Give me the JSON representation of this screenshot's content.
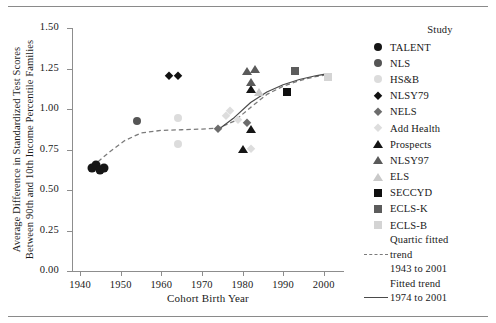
{
  "chart_data": {
    "type": "scatter",
    "title": "",
    "xlabel": "Cohort Birth Year",
    "ylabel_line1": "Average Difference in Standardized Test Scores",
    "ylabel_line2": "Between 90th and 10th Income Percentile Families",
    "xlim": [
      1938,
      2005
    ],
    "ylim": [
      0.0,
      1.5
    ],
    "xticks": [
      "1940",
      "1950",
      "1960",
      "1970",
      "1980",
      "1990",
      "2000"
    ],
    "xtick_values": [
      1940,
      1950,
      1960,
      1970,
      1980,
      1990,
      2000
    ],
    "yticks": [
      "0.00",
      "0.25",
      "0.50",
      "0.75",
      "1.00",
      "1.25",
      "1.50"
    ],
    "ytick_values": [
      0.0,
      0.25,
      0.5,
      0.75,
      1.0,
      1.25,
      1.5
    ],
    "grid": false,
    "legend_position": "right",
    "legend_title": "Study",
    "series": [
      {
        "name": "TALENT",
        "marker": "circle",
        "color": "#161616",
        "size": 9,
        "points": [
          {
            "x": 1943,
            "y": 0.635
          },
          {
            "x": 1944,
            "y": 0.655
          },
          {
            "x": 1945,
            "y": 0.625
          },
          {
            "x": 1946,
            "y": 0.635
          }
        ]
      },
      {
        "name": "NLS",
        "marker": "circle",
        "color": "#555555",
        "size": 8,
        "points": [
          {
            "x": 1954,
            "y": 0.925
          }
        ]
      },
      {
        "name": "HS&B",
        "marker": "circle",
        "color": "#dcdcdc",
        "size": 8,
        "points": [
          {
            "x": 1964,
            "y": 0.945
          },
          {
            "x": 1964,
            "y": 0.785
          }
        ]
      },
      {
        "name": "NLSY79",
        "marker": "diamond",
        "color": "#111111",
        "size": 8,
        "points": [
          {
            "x": 1962,
            "y": 1.205
          },
          {
            "x": 1964,
            "y": 1.205
          }
        ]
      },
      {
        "name": "NELS",
        "marker": "diamond",
        "color": "#6c6c6c",
        "size": 8,
        "points": [
          {
            "x": 1974,
            "y": 0.875
          },
          {
            "x": 1981,
            "y": 0.915
          }
        ]
      },
      {
        "name": "Add Health",
        "marker": "diamond",
        "color": "#dddddd",
        "size": 8,
        "points": [
          {
            "x": 1976,
            "y": 0.955
          },
          {
            "x": 1977,
            "y": 0.985
          },
          {
            "x": 1979,
            "y": 0.935
          },
          {
            "x": 1982,
            "y": 0.755
          }
        ]
      },
      {
        "name": "Prospects",
        "marker": "triangle",
        "color": "#151515",
        "size": 9,
        "points": [
          {
            "x": 1980,
            "y": 0.755
          },
          {
            "x": 1982,
            "y": 1.125
          },
          {
            "x": 1982,
            "y": 0.875
          }
        ]
      },
      {
        "name": "NLSY97",
        "marker": "triangle",
        "color": "#5a5a5a",
        "size": 9,
        "points": [
          {
            "x": 1981,
            "y": 1.235
          },
          {
            "x": 1982,
            "y": 1.165
          },
          {
            "x": 1983,
            "y": 1.245
          }
        ]
      },
      {
        "name": "ELS",
        "marker": "triangle",
        "color": "#c9c9c9",
        "size": 9,
        "points": [
          {
            "x": 1984,
            "y": 1.105
          }
        ]
      },
      {
        "name": "SECCYD",
        "marker": "square",
        "color": "#0f0f0f",
        "size": 8,
        "points": [
          {
            "x": 1991,
            "y": 1.105
          }
        ]
      },
      {
        "name": "ECLS-K",
        "marker": "square",
        "color": "#5c5c5c",
        "size": 8,
        "points": [
          {
            "x": 1993,
            "y": 1.235
          }
        ]
      },
      {
        "name": "ECLS-B",
        "marker": "square",
        "color": "#d4d4d4",
        "size": 8,
        "points": [
          {
            "x": 2001,
            "y": 1.195
          }
        ]
      }
    ],
    "trends": [
      {
        "name": "Quartic fitted trend 1943 to 2001",
        "style": "dashed",
        "color": "#7b7b7b",
        "label_line1": "Quartic fitted",
        "label_line2": "trend",
        "label_line3": "1943 to 2001",
        "path": [
          {
            "x": 1943,
            "y": 0.645
          },
          {
            "x": 1947,
            "y": 0.73
          },
          {
            "x": 1951,
            "y": 0.805
          },
          {
            "x": 1955,
            "y": 0.852
          },
          {
            "x": 1960,
            "y": 0.868
          },
          {
            "x": 1965,
            "y": 0.872
          },
          {
            "x": 1970,
            "y": 0.876
          },
          {
            "x": 1974,
            "y": 0.882
          },
          {
            "x": 1978,
            "y": 0.925
          },
          {
            "x": 1982,
            "y": 1.01
          },
          {
            "x": 1986,
            "y": 1.09
          },
          {
            "x": 1990,
            "y": 1.14
          },
          {
            "x": 1994,
            "y": 1.175
          },
          {
            "x": 1998,
            "y": 1.2
          },
          {
            "x": 2001,
            "y": 1.212
          }
        ]
      },
      {
        "name": "Fitted trend 1974 to 2001",
        "style": "solid",
        "color": "#4a4a4a",
        "label_line1": "Fitted trend",
        "label_line2": "1974 to 2001",
        "path": [
          {
            "x": 1974,
            "y": 0.872
          },
          {
            "x": 1978,
            "y": 0.948
          },
          {
            "x": 1982,
            "y": 1.04
          },
          {
            "x": 1986,
            "y": 1.105
          },
          {
            "x": 1990,
            "y": 1.15
          },
          {
            "x": 1994,
            "y": 1.182
          },
          {
            "x": 1998,
            "y": 1.205
          },
          {
            "x": 2001,
            "y": 1.218
          }
        ]
      }
    ]
  },
  "legend": {
    "title": "Study",
    "entries": [
      {
        "label": "TALENT",
        "marker": "circle",
        "color": "#161616"
      },
      {
        "label": "NLS",
        "marker": "circle",
        "color": "#555555"
      },
      {
        "label": "HS&B",
        "marker": "circle",
        "color": "#dcdcdc"
      },
      {
        "label": "NLSY79",
        "marker": "diamond",
        "color": "#111111"
      },
      {
        "label": "NELS",
        "marker": "diamond",
        "color": "#6c6c6c"
      },
      {
        "label": "Add Health",
        "marker": "diamond",
        "color": "#dddddd"
      },
      {
        "label": "Prospects",
        "marker": "triangle",
        "color": "#151515"
      },
      {
        "label": "NLSY97",
        "marker": "triangle",
        "color": "#5a5a5a"
      },
      {
        "label": "ELS",
        "marker": "triangle",
        "color": "#c9c9c9"
      },
      {
        "label": "SECCYD",
        "marker": "square",
        "color": "#0f0f0f"
      },
      {
        "label": "ECLS-K",
        "marker": "square",
        "color": "#5c5c5c"
      },
      {
        "label": "ECLS-B",
        "marker": "square",
        "color": "#d4d4d4"
      }
    ],
    "trend_entries": [
      {
        "style": "dashed",
        "lines": [
          "Quartic fitted",
          "trend",
          "1943 to 2001"
        ]
      },
      {
        "style": "solid",
        "lines": [
          "Fitted trend",
          "1974 to 2001"
        ]
      }
    ]
  }
}
